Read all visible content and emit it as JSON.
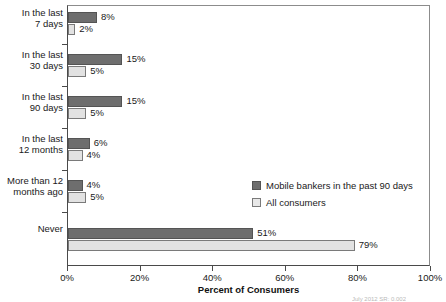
{
  "chart_data": {
    "type": "bar",
    "orientation": "horizontal",
    "title": "",
    "xlabel": "Percent of Consumers",
    "ylabel": "",
    "xlim": [
      0,
      100
    ],
    "xticks": [
      "0%",
      "20%",
      "40%",
      "60%",
      "80%",
      "100%"
    ],
    "xtick_values": [
      0,
      20,
      40,
      60,
      80,
      100
    ],
    "grid": false,
    "legend_position": "middle-right",
    "categories": [
      "In the last\n7 days",
      "In the last\n30 days",
      "In the last\n90 days",
      "In the last\n12 months",
      "More than 12\nmonths ago",
      "Never"
    ],
    "series": [
      {
        "name": "Mobile bankers in the past 90 days",
        "color": "#6e6e6e",
        "values": [
          8,
          15,
          15,
          6,
          4,
          51
        ],
        "labels": [
          "8%",
          "15%",
          "15%",
          "6%",
          "4%",
          "51%"
        ]
      },
      {
        "name": "All consumers",
        "color": "#e2e2e2",
        "values": [
          2,
          5,
          5,
          4,
          5,
          79
        ],
        "labels": [
          "2%",
          "5%",
          "5%",
          "4%",
          "5%",
          "79%"
        ]
      }
    ]
  },
  "legend": {
    "items": [
      {
        "label": "Mobile bankers in the past 90 days",
        "swatch": "dark"
      },
      {
        "label": "All consumers",
        "swatch": "light"
      }
    ]
  },
  "footnote": "July 2012          SR: 0.002"
}
